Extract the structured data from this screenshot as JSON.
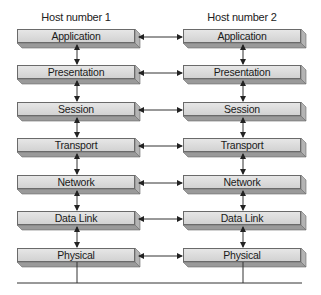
{
  "diagram": {
    "title": "",
    "hosts": [
      {
        "label": "Host number 1"
      },
      {
        "label": "Host number 2"
      }
    ],
    "layers": [
      {
        "name": "Application"
      },
      {
        "name": "Presentation"
      },
      {
        "name": "Session"
      },
      {
        "name": "Transport"
      },
      {
        "name": "Network"
      },
      {
        "name": "Data Link"
      },
      {
        "name": "Physical"
      }
    ],
    "connections": {
      "vertical_between_adjacent_layers": "bidirectional",
      "horizontal_peer_layers": "bidirectional",
      "physical_medium": "shared line below Physical layers"
    },
    "colors": {
      "box_face": "#dcdcdc",
      "box_side": "#9a9a9a",
      "box_edge": "#6a6a6a",
      "line": "#333333"
    }
  }
}
